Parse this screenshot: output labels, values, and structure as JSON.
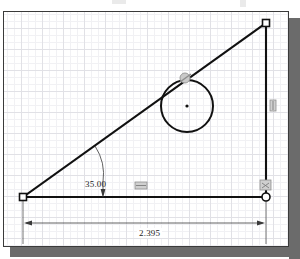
{
  "application": {
    "kind": "cad-sketch-viewport",
    "background_color": "#ffffff",
    "frame_border_color": "#3a3a3a",
    "shadow_color": "#6b6b6b",
    "grid": {
      "visible": true,
      "major_spacing_px": 21,
      "minor_spacing_px": 7,
      "major_color": "#dcdce2",
      "minor_color": "#eeeef2"
    }
  },
  "sketch": {
    "geometry_color": "#111111",
    "entities": [
      {
        "name": "base-line",
        "type": "line",
        "x1": 22,
        "y1": 196,
        "x2": 265,
        "y2": 196
      },
      {
        "name": "vertical-line",
        "type": "line",
        "x1": 265,
        "y1": 22,
        "x2": 265,
        "y2": 196
      },
      {
        "name": "hypotenuse-line",
        "type": "line",
        "x1": 22,
        "y1": 196,
        "x2": 265,
        "y2": 22
      },
      {
        "name": "tangent-circle",
        "type": "circle",
        "cx": 186,
        "cy": 105,
        "r": 26
      }
    ],
    "points": [
      {
        "name": "origin-point-left",
        "style": "square",
        "x": 22,
        "y": 196
      },
      {
        "name": "endpoint-top-right",
        "style": "square",
        "x": 265,
        "y": 22
      },
      {
        "name": "coincident-point-bottom-right",
        "style": "circle",
        "x": 265,
        "y": 196
      },
      {
        "name": "circle-center-point",
        "style": "dot",
        "x": 186,
        "y": 105
      }
    ]
  },
  "dimensions": {
    "angle": {
      "label": "35.00",
      "value": 35.0,
      "unit": "degrees",
      "type": "angular"
    },
    "length": {
      "label": "2.395",
      "value": 2.395,
      "unit": "inches",
      "type": "linear-horizontal"
    }
  },
  "constraints": [
    {
      "name": "tangent-constraint",
      "icon": "tangent-icon",
      "glyph": "◌",
      "x": 184,
      "y": 77
    },
    {
      "name": "vertical-constraint",
      "icon": "vertical-constraint-icon",
      "glyph": "‖",
      "x": 272,
      "y": 104
    },
    {
      "name": "horizontal-constraint",
      "icon": "horizontal-constraint-icon",
      "glyph": "═",
      "x": 139,
      "y": 186
    },
    {
      "name": "coincident-constraint",
      "icon": "coincident-constraint-icon",
      "glyph": "✦",
      "x": 265,
      "y": 184
    }
  ]
}
